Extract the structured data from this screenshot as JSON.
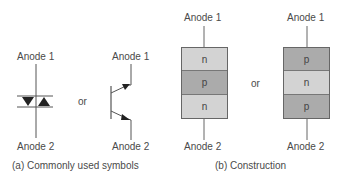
{
  "symbols": {
    "triac_symbol": {
      "top_label": "Anode 1",
      "bottom_label": "Anode 2"
    },
    "or_label": "or",
    "transistor_symbol": {
      "top_label": "Anode 1",
      "bottom_label": "Anode 2"
    },
    "caption": "(a)  Commonly used symbols"
  },
  "construction": {
    "npn": {
      "top_label": "Anode 1",
      "bottom_label": "Anode 2",
      "layers": [
        "n",
        "p",
        "n"
      ]
    },
    "or_label": "or",
    "pnp": {
      "top_label": "Anode 1",
      "bottom_label": "Anode 2",
      "layers": [
        "p",
        "n",
        "p"
      ]
    },
    "caption": "(b)  Construction"
  },
  "colors": {
    "light_layer": "#d3d3d3",
    "dark_layer": "#ababab",
    "line": "#555555"
  }
}
